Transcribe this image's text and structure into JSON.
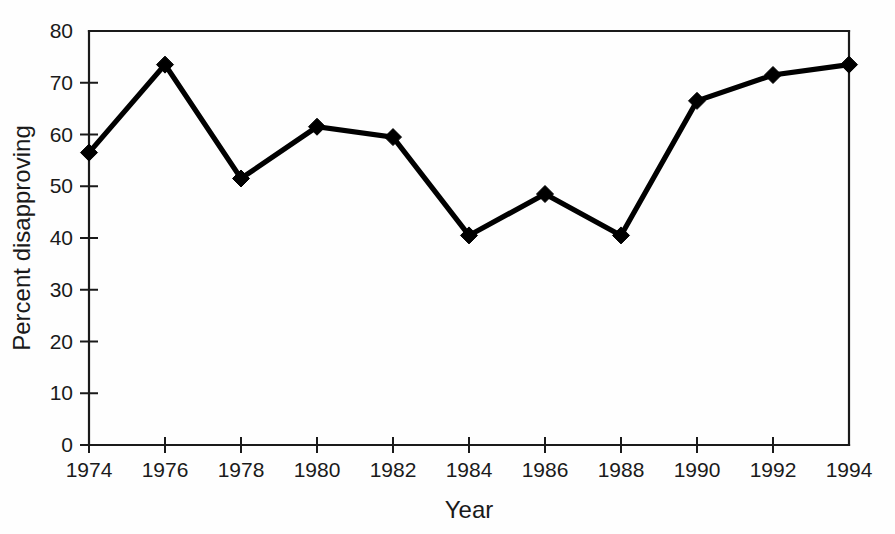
{
  "chart_data": {
    "type": "line",
    "title": "",
    "xlabel": "Year",
    "ylabel": "Percent disapproving",
    "x": [
      1974,
      1976,
      1978,
      1980,
      1982,
      1984,
      1986,
      1988,
      1990,
      1992,
      1994
    ],
    "values": [
      56.5,
      73.5,
      51.5,
      61.5,
      59.5,
      40.5,
      48.5,
      40.5,
      66.5,
      71.5,
      73.5
    ],
    "xtick_labels": [
      "1974",
      "1976",
      "1978",
      "1980",
      "1982",
      "1984",
      "1986",
      "1988",
      "1990",
      "1992",
      "1994"
    ],
    "ytick_labels": [
      "0",
      "10",
      "20",
      "30",
      "40",
      "50",
      "60",
      "70",
      "80"
    ],
    "yticks": [
      0,
      10,
      20,
      30,
      40,
      50,
      60,
      70,
      80
    ],
    "xlim": [
      1974,
      1994
    ],
    "ylim": [
      0,
      80
    ],
    "grid": false,
    "legend": false,
    "marker": "diamond",
    "line_color": "#000000",
    "marker_color": "#000000",
    "background_color": "#ffffff"
  }
}
